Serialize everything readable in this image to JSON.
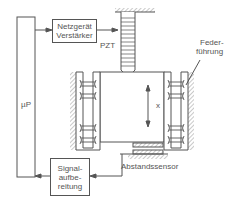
{
  "diagram": {
    "controller": {
      "label": "µP"
    },
    "amplifier": {
      "line1": "Netzgerät",
      "line2": "Verstärker"
    },
    "actuator": {
      "label": "PZT"
    },
    "spring_guide": {
      "line1": "Feder-",
      "line2": "führung"
    },
    "displacement": {
      "label": "x"
    },
    "signal_processing": {
      "line1": "Signal-",
      "line2": "aufbe-",
      "line3": "reitung"
    },
    "sensor": {
      "label": "Abstandssensor"
    }
  }
}
